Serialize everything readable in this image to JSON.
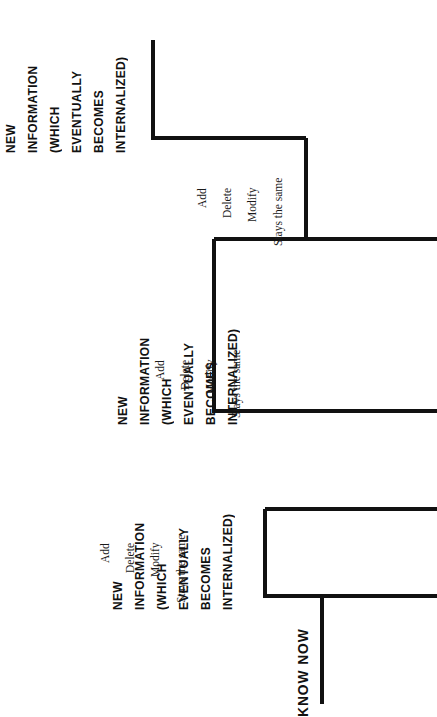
{
  "diagram": {
    "type": "staircase",
    "orientation": "rotated-90-ccw",
    "background_color": "#ffffff",
    "line_color": "#111111",
    "start_label": "KNOW NOW",
    "step_heading_lines": [
      "NEW",
      "INFORMATION",
      "(WHICH",
      "EVENTUALLY",
      "BECOMES",
      "INTERNALIZED)"
    ],
    "riser_labels": [
      "Add",
      "Delete",
      "Modify",
      "Stays the same"
    ],
    "steps": [
      {
        "index": 1,
        "heading_lines": [
          "NEW",
          "INFORMATION",
          "(WHICH",
          "EVENTUALLY",
          "BECOMES",
          "INTERNALIZED)"
        ],
        "riser_labels": [
          "Add",
          "Delete",
          "Modify",
          "Stays the same"
        ]
      },
      {
        "index": 2,
        "heading_lines": [
          "NEW",
          "INFORMATION",
          "(WHICH",
          "EVENTUALLY",
          "BECOMES",
          "INTERNALIZED)"
        ],
        "riser_labels": [
          "Add",
          "Delete",
          "Modify",
          "Stays the same"
        ]
      },
      {
        "index": 3,
        "heading_lines": [
          "NEW",
          "INFORMATION",
          "(WHICH",
          "EVENTUALLY",
          "BECOMES",
          "INTERNALIZED)"
        ],
        "riser_labels": [
          "Add",
          "Delete",
          "Modify",
          "Stays the same"
        ]
      }
    ]
  },
  "s1": {
    "l0": "NEW",
    "l1": "INFORMATION",
    "l2": "(WHICH",
    "l3": "EVENTUALLY",
    "l4": "BECOMES",
    "l5": "INTERNALIZED)",
    "r0": "Add",
    "r1": "Delete",
    "r2": "Modify",
    "r3": "Stays the same"
  },
  "s2": {
    "l0": "NEW",
    "l1": "INFORMATION",
    "l2": "(WHICH",
    "l3": "EVENTUALLY",
    "l4": "BECOMES",
    "l5": "INTERNALIZED)",
    "r0": "Add",
    "r1": "Delete",
    "r2": "Modify",
    "r3": "Stays the same"
  },
  "s3": {
    "l0": "NEW",
    "l1": "INFORMATION",
    "l2": "(WHICH",
    "l3": "EVENTUALLY",
    "l4": "BECOMES",
    "l5": "INTERNALIZED)",
    "r0": "Add",
    "r1": "Delete",
    "r2": "Modify",
    "r3": "Stays the same"
  },
  "base": {
    "label": "KNOW NOW"
  }
}
